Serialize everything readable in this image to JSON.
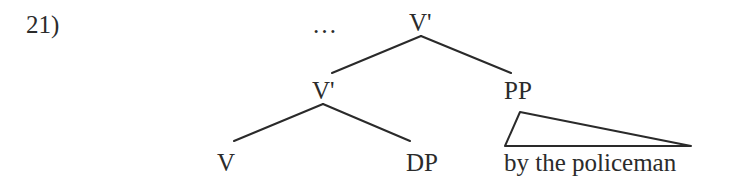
{
  "example": {
    "number": "21)"
  },
  "tree": {
    "ellipsis": "…",
    "nodes": {
      "root": "V'",
      "vbar_inner": "V'",
      "pp": "PP",
      "v": "V",
      "dp": "DP"
    },
    "pp_content": "by the policeman",
    "triangle": true,
    "line_color": "#2a2a2a"
  }
}
